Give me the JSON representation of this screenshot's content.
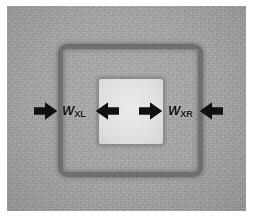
{
  "figure": {
    "type": "annotated-micrograph",
    "canvas": {
      "width": 258,
      "height": 224,
      "background": "#ffffff"
    },
    "micrograph": {
      "name": "sem-substrate-field",
      "fill_color": "#a9a9a9",
      "description": "Grainy grey substrate field"
    },
    "features": [
      {
        "name": "outer-ring",
        "shape": "rounded-square-outline",
        "stroke_color": "#6e6e6e",
        "description": "Outer etched square trench outline"
      },
      {
        "name": "inner-square",
        "shape": "rounded-square",
        "fill_color": "#e2e2e0",
        "stroke_color": "#8d8d8d",
        "description": "Inner bright mesa square"
      }
    ],
    "arrows": [
      {
        "name": "arrow-outer-left",
        "direction": "right",
        "color": "#101010"
      },
      {
        "name": "arrow-inner-left",
        "direction": "left",
        "color": "#101010"
      },
      {
        "name": "arrow-inner-right",
        "direction": "right",
        "color": "#101010"
      },
      {
        "name": "arrow-outer-right",
        "direction": "left",
        "color": "#101010"
      }
    ],
    "labels": [
      {
        "name": "label-w-xl",
        "symbol": "W",
        "subscript": "XL",
        "full_text": "WXL",
        "meaning": "Left sidewall width"
      },
      {
        "name": "label-w-xr",
        "symbol": "W",
        "subscript": "XR",
        "full_text": "WXR",
        "meaning": "Right sidewall width"
      }
    ]
  }
}
